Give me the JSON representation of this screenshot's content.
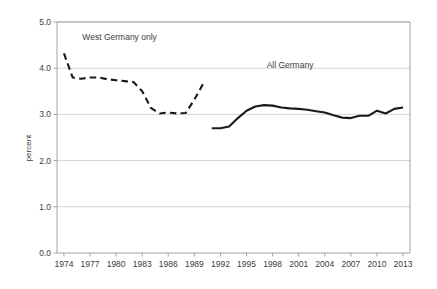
{
  "chart_data": {
    "type": "line",
    "title": "",
    "xlabel": "",
    "ylabel": "percent",
    "xlim": [
      1973.2,
      2013.8
    ],
    "ylim": [
      0.0,
      5.0
    ],
    "grid": true,
    "grid_axis": "y",
    "legend_position": "inline-annotation",
    "xticks": [
      "1974",
      "1977",
      "1980",
      "1983",
      "1986",
      "1989",
      "1992",
      "1995",
      "1998",
      "2001",
      "2004",
      "2007",
      "2010",
      "2013"
    ],
    "xtick_values": [
      1974,
      1977,
      1980,
      1983,
      1986,
      1989,
      1992,
      1995,
      1998,
      2001,
      2004,
      2007,
      2010,
      2013
    ],
    "yticks": [
      "0.0",
      "1.0",
      "2.0",
      "3.0",
      "4.0",
      "5.0"
    ],
    "ytick_values": [
      0.0,
      1.0,
      2.0,
      3.0,
      4.0,
      5.0
    ],
    "series": [
      {
        "name": "West Germany only",
        "style": "dashed",
        "color": "#1a1a1a",
        "x": [
          1974,
          1975,
          1976,
          1977,
          1978,
          1979,
          1980,
          1981,
          1982,
          1983,
          1984,
          1985,
          1986,
          1987,
          1988,
          1989,
          1990
        ],
        "values": [
          4.32,
          3.8,
          3.77,
          3.8,
          3.8,
          3.76,
          3.74,
          3.72,
          3.7,
          3.5,
          3.14,
          3.02,
          3.04,
          3.02,
          3.03,
          3.32,
          3.66
        ]
      },
      {
        "name": "All Germany",
        "style": "solid",
        "color": "#1a1a1a",
        "x": [
          1991,
          1992,
          1993,
          1994,
          1995,
          1996,
          1997,
          1998,
          1999,
          2000,
          2001,
          2002,
          2003,
          2004,
          2005,
          2006,
          2007,
          2008,
          2009,
          2010,
          2011,
          2012,
          2013
        ],
        "values": [
          2.7,
          2.7,
          2.74,
          2.92,
          3.08,
          3.17,
          3.2,
          3.19,
          3.15,
          3.13,
          3.12,
          3.1,
          3.07,
          3.04,
          2.98,
          2.93,
          2.92,
          2.97,
          2.97,
          3.08,
          3.02,
          3.12,
          3.15
        ]
      }
    ],
    "annotations": [
      {
        "text": "West Germany only",
        "x": 1980.4,
        "y": 4.62
      },
      {
        "text": "All Germany",
        "x": 2000.0,
        "y": 4.0
      }
    ]
  },
  "axes": {
    "y_axis_title": "percent"
  }
}
